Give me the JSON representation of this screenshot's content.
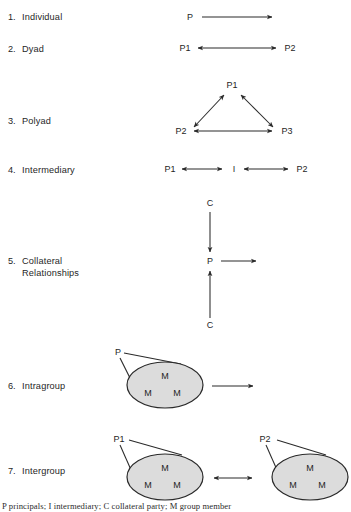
{
  "figure": {
    "title_rows": [
      {
        "num": "1.",
        "label": "Individual"
      },
      {
        "num": "2.",
        "label": "Dyad"
      },
      {
        "num": "3.",
        "label": "Polyad"
      },
      {
        "num": "4.",
        "label": "Intermediary"
      },
      {
        "num": "5.",
        "label": "Collateral",
        "label2": "Relationships"
      },
      {
        "num": "6.",
        "label": "Intragroup"
      },
      {
        "num": "7.",
        "label": "Intergroup"
      }
    ],
    "legend": "P principals; I intermediary; C collateral party; M group member",
    "colors": {
      "ink": "#2a2a2a",
      "text": "#1f1f1f",
      "group_fill": "#dcdcdc",
      "background": "#ffffff"
    }
  },
  "diagram_nodes": {
    "individual": {
      "p": "P"
    },
    "dyad": {
      "p1": "P1",
      "p2": "P2"
    },
    "polyad": {
      "p1": "P1",
      "p2": "P2",
      "p3": "P3"
    },
    "intermediary": {
      "p1": "P1",
      "i": "I",
      "p2": "P2"
    },
    "collateral": {
      "c_top": "C",
      "p": "P",
      "c_bottom": "C"
    },
    "intragroup": {
      "p": "P",
      "members": [
        "M",
        "M",
        "M"
      ]
    },
    "intergroup": {
      "p1": "P1",
      "p2": "P2",
      "group1_members": [
        "M",
        "M",
        "M"
      ],
      "group2_members": [
        "M",
        "M",
        "M"
      ]
    }
  }
}
